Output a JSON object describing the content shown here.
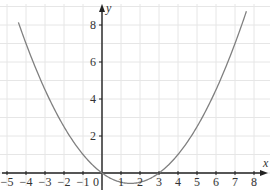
{
  "chart_data": {
    "type": "line",
    "title": "",
    "xlabel": "x",
    "ylabel": "y",
    "xlim": [
      -5,
      8
    ],
    "ylim": [
      -0.6,
      8.5
    ],
    "grid": true,
    "x_ticks": [
      -5,
      -4,
      -3,
      -2,
      -1,
      0,
      1,
      2,
      3,
      4,
      5,
      6,
      7,
      8
    ],
    "x_tick_labels": [
      "−5",
      "−4",
      "−3",
      "−2",
      "−1",
      "0",
      "1",
      "2",
      "3",
      "4",
      "5",
      "6",
      "7",
      "8"
    ],
    "y_ticks": [
      2,
      4,
      6,
      8
    ],
    "y_tick_labels": [
      "2",
      "4",
      "6",
      "8"
    ],
    "series": [
      {
        "name": "parabola",
        "equation": "y = (x^2 - 3x)/4",
        "color": "#808080",
        "x": [
          -4.4,
          -4,
          -3,
          -2,
          -1,
          0,
          1,
          1.5,
          2,
          3,
          4,
          5,
          6,
          7,
          7.6
        ],
        "y": [
          8.14,
          7.0,
          4.5,
          2.5,
          1.0,
          0.0,
          -0.5,
          -0.5625,
          -0.5,
          0.0,
          1.0,
          2.5,
          4.5,
          7.0,
          8.74
        ]
      }
    ],
    "roots": [
      0,
      3
    ],
    "vertex": [
      1.5,
      -0.5625
    ]
  },
  "colors": {
    "grid": "#e6e6e6",
    "axis": "#222222",
    "curve": "#808080"
  }
}
